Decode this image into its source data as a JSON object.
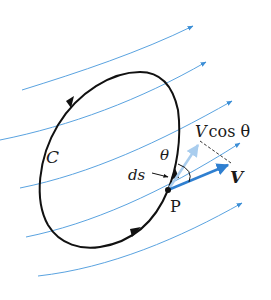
{
  "diagram": {
    "labels": {
      "curve": "C",
      "point": "P",
      "angle": "θ",
      "element": "ds",
      "component_v": "V",
      "component_rest": "cos θ",
      "velocity": "V"
    },
    "colors": {
      "streamline": "#3d8fd6",
      "velocity_vector": "#2f7fd0",
      "component_vector": "#a9cdee",
      "curve": "#111111",
      "dashed": "#333333"
    },
    "streamlines": [
      {
        "id": 1,
        "from": [
          22,
          90
        ],
        "to": [
          193,
          26
        ]
      },
      {
        "id": 2,
        "from": [
          0,
          140
        ],
        "to": [
          206,
          62
        ]
      },
      {
        "id": 3,
        "from": [
          10,
          188
        ],
        "to": [
          232,
          101
        ]
      },
      {
        "id": 4,
        "from": [
          26,
          237
        ],
        "to": [
          240,
          143
        ]
      },
      {
        "id": 5,
        "from": [
          38,
          276
        ],
        "to": [
          242,
          203
        ]
      }
    ]
  }
}
